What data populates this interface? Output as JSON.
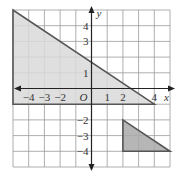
{
  "diagram": {
    "type": "coordinate-grid",
    "grid": {
      "xmin": -5,
      "xmax": 5,
      "ymin": -5,
      "ymax": 5,
      "color": "#9a9a9a"
    },
    "axes": {
      "x_label": "x",
      "y_label": "y",
      "origin_label": "O",
      "x_ticks": [
        {
          "value": -4,
          "label": "−4"
        },
        {
          "value": -3,
          "label": "−3"
        },
        {
          "value": -2,
          "label": "−2"
        },
        {
          "value": 1,
          "label": "1"
        },
        {
          "value": 2,
          "label": "2"
        },
        {
          "value": 4,
          "label": "4"
        }
      ],
      "y_ticks": [
        {
          "value": 4,
          "label": "4"
        },
        {
          "value": 3,
          "label": "3"
        },
        {
          "value": 1,
          "label": "1"
        },
        {
          "value": -2,
          "label": "−2"
        },
        {
          "value": -3,
          "label": "−3"
        },
        {
          "value": -4,
          "label": "−4"
        }
      ]
    },
    "shapes": [
      {
        "name": "large-triangle",
        "vertices": [
          [
            -5,
            5
          ],
          [
            -5,
            -1
          ],
          [
            4,
            -1
          ]
        ],
        "fill": "#d9d9d9",
        "stroke": "#555555"
      },
      {
        "name": "small-triangle",
        "vertices": [
          [
            2,
            -2
          ],
          [
            2,
            -4
          ],
          [
            5,
            -4
          ]
        ],
        "fill": "#a9a9a9",
        "stroke": "#555555"
      }
    ]
  }
}
